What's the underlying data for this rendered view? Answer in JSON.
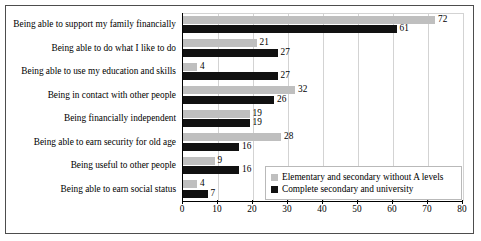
{
  "chart_data": {
    "type": "bar",
    "orientation": "horizontal",
    "title": "",
    "xlabel": "",
    "ylabel": "",
    "xlim": [
      0,
      80
    ],
    "xticks": [
      0,
      10,
      20,
      30,
      40,
      50,
      60,
      70,
      80
    ],
    "grid": "vertical",
    "legend_position": "inside-bottom-right",
    "categories": [
      "Being able to support my family financially",
      "Being able to do what I like to do",
      "Being able to use my education and skills",
      "Being in contact with other people",
      "Being financially independent",
      "Being able to earn security for old age",
      "Being useful to other people",
      "Being able to earn social status"
    ],
    "series": [
      {
        "name": "Elementary and secondary without A levels",
        "color": "#bfbfbf",
        "values": [
          72,
          21,
          4,
          32,
          19,
          28,
          9,
          4
        ]
      },
      {
        "name": "Complete secondary and university",
        "color": "#111111",
        "values": [
          61,
          27,
          27,
          26,
          19,
          16,
          16,
          7
        ]
      }
    ]
  }
}
